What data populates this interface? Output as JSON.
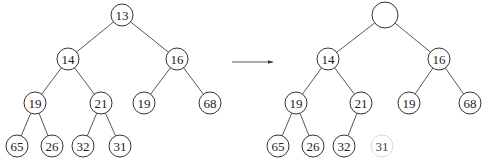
{
  "trees": [
    {
      "id": "before",
      "nodes": [
        {
          "id": "a0",
          "label": "13",
          "x": 122,
          "y": 15,
          "r": 11
        },
        {
          "id": "a1",
          "label": "14",
          "x": 68,
          "y": 59,
          "r": 11
        },
        {
          "id": "a2",
          "label": "16",
          "x": 177,
          "y": 59,
          "r": 11
        },
        {
          "id": "a3",
          "label": "19",
          "x": 35,
          "y": 103,
          "r": 11
        },
        {
          "id": "a4",
          "label": "21",
          "x": 101,
          "y": 103,
          "r": 11
        },
        {
          "id": "a5",
          "label": "19",
          "x": 144,
          "y": 103,
          "r": 11
        },
        {
          "id": "a6",
          "label": "68",
          "x": 210,
          "y": 103,
          "r": 11
        },
        {
          "id": "a7",
          "label": "65",
          "x": 17,
          "y": 146,
          "r": 11
        },
        {
          "id": "a8",
          "label": "26",
          "x": 52,
          "y": 146,
          "r": 11
        },
        {
          "id": "a9",
          "label": "32",
          "x": 83,
          "y": 146,
          "r": 11
        },
        {
          "id": "a10",
          "label": "31",
          "x": 120,
          "y": 146,
          "r": 11
        }
      ],
      "edges": [
        [
          "a0",
          "a1"
        ],
        [
          "a0",
          "a2"
        ],
        [
          "a1",
          "a3"
        ],
        [
          "a1",
          "a4"
        ],
        [
          "a2",
          "a5"
        ],
        [
          "a2",
          "a6"
        ],
        [
          "a3",
          "a7"
        ],
        [
          "a3",
          "a8"
        ],
        [
          "a4",
          "a9"
        ],
        [
          "a4",
          "a10"
        ]
      ]
    },
    {
      "id": "after",
      "nodes": [
        {
          "id": "b0",
          "label": "",
          "x": 385,
          "y": 15,
          "r": 13
        },
        {
          "id": "b1",
          "label": "14",
          "x": 328,
          "y": 59,
          "r": 11
        },
        {
          "id": "b2",
          "label": "16",
          "x": 439,
          "y": 59,
          "r": 11
        },
        {
          "id": "b3",
          "label": "19",
          "x": 296,
          "y": 103,
          "r": 11
        },
        {
          "id": "b4",
          "label": "21",
          "x": 361,
          "y": 103,
          "r": 11
        },
        {
          "id": "b5",
          "label": "19",
          "x": 409,
          "y": 103,
          "r": 11
        },
        {
          "id": "b6",
          "label": "68",
          "x": 470,
          "y": 103,
          "r": 11
        },
        {
          "id": "b7",
          "label": "65",
          "x": 278,
          "y": 146,
          "r": 11
        },
        {
          "id": "b8",
          "label": "26",
          "x": 313,
          "y": 146,
          "r": 11
        },
        {
          "id": "b9",
          "label": "32",
          "x": 344,
          "y": 146,
          "r": 11
        },
        {
          "id": "b10",
          "label": "31",
          "x": 382,
          "y": 146,
          "r": 11,
          "faded": true
        }
      ],
      "edges": [
        [
          "b0",
          "b1"
        ],
        [
          "b0",
          "b2"
        ],
        [
          "b1",
          "b3"
        ],
        [
          "b1",
          "b4"
        ],
        [
          "b2",
          "b5"
        ],
        [
          "b2",
          "b6"
        ],
        [
          "b3",
          "b7"
        ],
        [
          "b3",
          "b8"
        ],
        [
          "b4",
          "b9"
        ]
      ]
    }
  ],
  "arrow": {
    "x1": 232,
    "y1": 62,
    "x2": 273,
    "y2": 62
  }
}
